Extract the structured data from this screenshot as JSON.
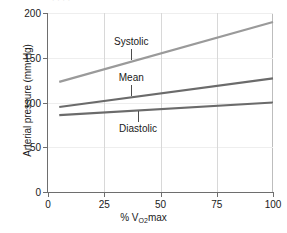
{
  "figure": {
    "caption_fragment": "·  ·   ·    ·"
  },
  "chart_data": {
    "type": "line",
    "title": "",
    "xlabel": "% V",
    "xlabel_sub": "O2",
    "xlabel_tail": "max",
    "ylabel": "Arterial pressure (mm Hg)",
    "xlim": [
      0,
      100
    ],
    "ylim": [
      0,
      200
    ],
    "xticks": [
      0,
      25,
      50,
      75,
      100
    ],
    "xtick_labels": [
      "0",
      "25",
      "50",
      "75",
      "100"
    ],
    "yticks": [
      0,
      50,
      100,
      150,
      200
    ],
    "ytick_labels": [
      "0",
      "50",
      "100",
      "150",
      "200"
    ],
    "grid": "vertical gridlines at x ticks, faint horizontal gridlines at y ticks",
    "legend": "inline labels with leader lines",
    "series": [
      {
        "name": "Systolic",
        "color": "#9a9a9a",
        "x": [
          5,
          100
        ],
        "values": [
          123,
          190
        ],
        "label_x": 37,
        "label_y": 168,
        "leader_from": 160,
        "leader_to": 147
      },
      {
        "name": "Mean",
        "color": "#6b6b6b",
        "x": [
          5,
          100
        ],
        "values": [
          95,
          127
        ],
        "label_x": 37,
        "label_y": 127,
        "leader_from": 119,
        "leader_to": 107
      },
      {
        "name": "Diastolic",
        "color": "#6b6b6b",
        "x": [
          5,
          100
        ],
        "values": [
          86,
          100
        ],
        "label_x": 40,
        "label_y": 70,
        "leader_from": 78,
        "leader_to": 91
      }
    ]
  },
  "annotations": {
    "systolic_label": "Systolic",
    "mean_label": "Mean",
    "diastolic_label": "Diastolic"
  }
}
